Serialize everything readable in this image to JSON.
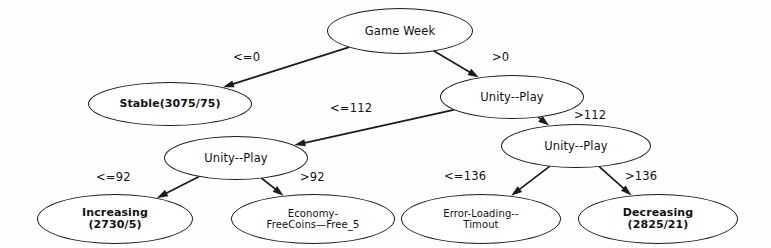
{
  "diagram": {
    "type": "decision-tree",
    "nodes": [
      {
        "id": "root",
        "label": "Game Week",
        "kind": "internal",
        "cx": 400,
        "cy": 31,
        "rx": 73,
        "ry": 23
      },
      {
        "id": "stable",
        "label": "Stable(3075/75)",
        "kind": "leaf-bold",
        "cx": 170,
        "cy": 104,
        "rx": 82,
        "ry": 22
      },
      {
        "id": "unity-a",
        "label": "Unity--Play",
        "kind": "internal",
        "cx": 512,
        "cy": 97,
        "rx": 72,
        "ry": 22
      },
      {
        "id": "unity-b",
        "label": "Unity--Play",
        "kind": "internal",
        "cx": 236,
        "cy": 158,
        "rx": 72,
        "ry": 22
      },
      {
        "id": "unity-c",
        "label": "Unity--Play",
        "kind": "internal",
        "cx": 576,
        "cy": 146,
        "rx": 75,
        "ry": 22
      },
      {
        "id": "increasing",
        "label": "Increasing\n(2730/5)",
        "kind": "leaf-bold",
        "cx": 115,
        "cy": 219,
        "rx": 78,
        "ry": 25
      },
      {
        "id": "economy",
        "label": "Economy-\nFreeCoins—Free_5",
        "kind": "leaf-plain",
        "cx": 313,
        "cy": 219,
        "rx": 82,
        "ry": 25
      },
      {
        "id": "errorload",
        "label": "Error-Loading--\nTimout",
        "kind": "leaf-plain",
        "cx": 481,
        "cy": 219,
        "rx": 80,
        "ry": 25
      },
      {
        "id": "decreasing",
        "label": "Decreasing\n(2825/21)",
        "kind": "leaf-bold",
        "cx": 658,
        "cy": 219,
        "rx": 80,
        "ry": 25
      }
    ],
    "edges": [
      {
        "id": "e-root-stable",
        "from": "root",
        "to": "stable",
        "label": "<=0",
        "label_x": 233,
        "label_y": 50
      },
      {
        "id": "e-root-unity-a",
        "from": "root",
        "to": "unity-a",
        "label": ">0",
        "label_x": 492,
        "label_y": 50
      },
      {
        "id": "e-unity-a-unity-b",
        "from": "unity-a",
        "to": "unity-b",
        "label": "<=112",
        "label_x": 330,
        "label_y": 101
      },
      {
        "id": "e-unity-a-unity-c",
        "from": "unity-a",
        "to": "unity-c",
        "label": ">112",
        "label_x": 574,
        "label_y": 108
      },
      {
        "id": "e-unity-b-increasing",
        "from": "unity-b",
        "to": "increasing",
        "label": "<=92",
        "label_x": 96,
        "label_y": 170
      },
      {
        "id": "e-unity-b-economy",
        "from": "unity-b",
        "to": "economy",
        "label": ">92",
        "label_x": 300,
        "label_y": 170
      },
      {
        "id": "e-unity-c-errorload",
        "from": "unity-c",
        "to": "errorload",
        "label": "<=136",
        "label_x": 444,
        "label_y": 169
      },
      {
        "id": "e-unity-c-decreasing",
        "from": "unity-c",
        "to": "decreasing",
        "label": ">136",
        "label_x": 625,
        "label_y": 169
      }
    ]
  }
}
